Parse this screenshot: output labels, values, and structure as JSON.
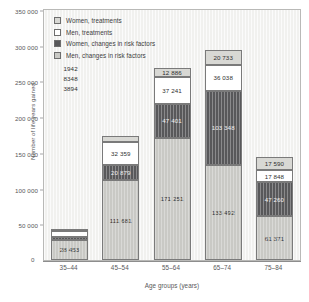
{
  "chart_data": {
    "type": "bar",
    "stacked": true,
    "title": "",
    "xlabel": "Age groups (years)",
    "ylabel": "Number of life years gained",
    "categories": [
      "35–44",
      "45–54",
      "55–64",
      "65–74",
      "75–84"
    ],
    "ylim": [
      0,
      350000
    ],
    "yticks": [
      "0",
      "50 000",
      "100 000",
      "150 000",
      "200 000",
      "250 000",
      "300 000",
      "350 000"
    ],
    "ytick_values": [
      0,
      50000,
      100000,
      150000,
      200000,
      250000,
      300000,
      350000
    ],
    "grid": false,
    "legend_position": "top-left",
    "series": [
      {
        "name": "Men, changes in risk factors",
        "color": "#c9c9c5",
        "values": [
          28453,
          111681,
          171251,
          133492,
          61371
        ],
        "labels": [
          "28 453",
          "111 681",
          "171 251",
          "133 492",
          "61 371"
        ]
      },
      {
        "name": "Women, changes in risk factors",
        "color": "#58585a",
        "values": [
          3894,
          20879,
          47401,
          103348,
          47260
        ],
        "labels": [
          "3894",
          "20 879",
          "47 401",
          "103 348",
          "47 260"
        ]
      },
      {
        "name": "Men, treatments",
        "color": "#ffffff",
        "values": [
          8348,
          32359,
          37241,
          36038,
          17848
        ],
        "labels": [
          "8348",
          "32 359",
          "37 241",
          "36 038",
          "17 848"
        ]
      },
      {
        "name": "Women, treatments",
        "color": "#d8d8d4",
        "values": [
          1942,
          8269,
          12886,
          20733,
          17590
        ],
        "labels": [
          "1942",
          "8269",
          "12 886",
          "20 733",
          "17 590"
        ]
      }
    ],
    "totals": [
      42637,
      173188,
      268779,
      293611,
      144069
    ]
  },
  "legend": {
    "items": [
      {
        "label": "Women, treatments",
        "color": "#d8d8d4"
      },
      {
        "label": "Men, treatments",
        "color": "#ffffff"
      },
      {
        "label": "Women, changes in risk factors",
        "color": "#58585a"
      },
      {
        "label": "Men, changes in risk factors",
        "color": "#c9c9c5"
      }
    ]
  },
  "axes": {
    "y_title": "Number of life years gained",
    "x_title": "Age groups (years)",
    "origin_label": "0"
  }
}
